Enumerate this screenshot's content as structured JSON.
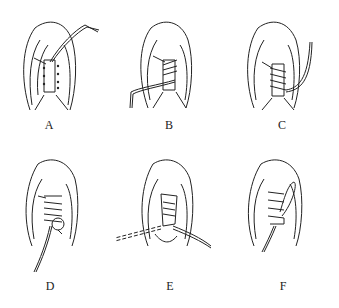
{
  "diagram": {
    "panels": [
      {
        "id": "A",
        "label": "A",
        "description": "Lace threaded through top eyelets, one end pulled up"
      },
      {
        "id": "B",
        "label": "B",
        "description": "Lace crossed down through eyelets, end pulled out left"
      },
      {
        "id": "C",
        "label": "C",
        "description": "Lace crisscrossed through all eyelets, end out right"
      },
      {
        "id": "D",
        "label": "D",
        "description": "Lace looped at bottom with arrows indicating direction"
      },
      {
        "id": "E",
        "label": "E",
        "description": "Lace pulled through with dashed path extending left"
      },
      {
        "id": "F",
        "label": "F",
        "description": "Completed lacing with loop tied"
      }
    ]
  },
  "colors": {
    "line": "#222222",
    "background": "#ffffff"
  }
}
